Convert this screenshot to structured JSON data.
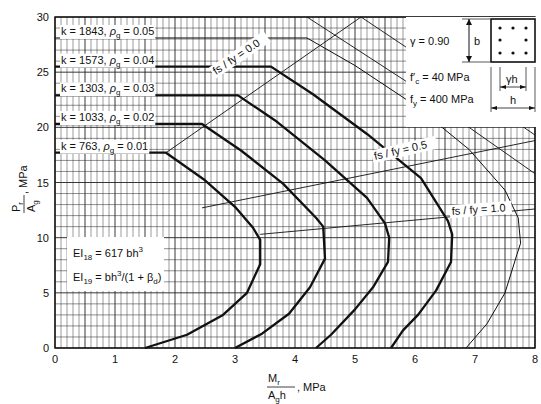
{
  "chart_data": {
    "type": "line",
    "title": "",
    "xlabel": "Mr / (Ag h), MPa",
    "ylabel": "Pr / Ag, MPa",
    "xlim": [
      0,
      8
    ],
    "ylim": [
      0,
      30
    ],
    "x_ticks": [
      "0",
      "1",
      "2",
      "3",
      "4",
      "5",
      "6",
      "7",
      "8"
    ],
    "y_ticks": [
      "0",
      "5",
      "10",
      "15",
      "20",
      "25",
      "30"
    ],
    "grid": true,
    "series": [
      {
        "name": "k = 763, ρg = 0.01",
        "k": 763,
        "rho_g": 0.01,
        "weight": "bold",
        "points": [
          [
            0,
            17.7
          ],
          [
            1.85,
            17.7
          ],
          [
            2.5,
            15.2
          ],
          [
            3.0,
            12.8
          ],
          [
            3.3,
            10.9
          ],
          [
            3.42,
            9.8
          ],
          [
            3.42,
            7.6
          ],
          [
            3.2,
            5.0
          ],
          [
            2.8,
            3.0
          ],
          [
            2.2,
            1.2
          ],
          [
            1.5,
            0
          ]
        ]
      },
      {
        "name": "k = 1033, ρg = 0.02",
        "k": 1033,
        "rho_g": 0.02,
        "weight": "bold",
        "points": [
          [
            0,
            20.3
          ],
          [
            2.45,
            20.3
          ],
          [
            3.1,
            17.9
          ],
          [
            3.8,
            14.9
          ],
          [
            4.35,
            11.8
          ],
          [
            4.47,
            11.0
          ],
          [
            4.5,
            8.1
          ],
          [
            4.25,
            5.5
          ],
          [
            3.9,
            3.1
          ],
          [
            3.45,
            1.3
          ],
          [
            3.0,
            0
          ]
        ]
      },
      {
        "name": "k = 1303, ρg = 0.03",
        "k": 1303,
        "rho_g": 0.03,
        "weight": "bold",
        "points": [
          [
            0,
            22.9
          ],
          [
            3.05,
            22.9
          ],
          [
            3.7,
            20.5
          ],
          [
            4.5,
            17.0
          ],
          [
            5.2,
            13.6
          ],
          [
            5.5,
            11.3
          ],
          [
            5.57,
            10.0
          ],
          [
            5.55,
            7.8
          ],
          [
            5.3,
            5.5
          ],
          [
            5.0,
            3.5
          ],
          [
            4.6,
            1.2
          ],
          [
            4.35,
            0
          ]
        ]
      },
      {
        "name": "k = 1573, ρg = 0.04",
        "k": 1573,
        "rho_g": 0.04,
        "weight": "bold",
        "points": [
          [
            0,
            25.5
          ],
          [
            3.6,
            25.5
          ],
          [
            4.3,
            23.0
          ],
          [
            5.2,
            19.4
          ],
          [
            6.1,
            15.4
          ],
          [
            6.55,
            11.5
          ],
          [
            6.62,
            10.3
          ],
          [
            6.6,
            7.8
          ],
          [
            6.35,
            5.2
          ],
          [
            6.05,
            3.0
          ],
          [
            5.8,
            1.6
          ],
          [
            5.6,
            0
          ]
        ]
      },
      {
        "name": "k = 1843, ρg = 0.05",
        "k": 1843,
        "rho_g": 0.05,
        "weight": "thin",
        "points": [
          [
            0,
            28.1
          ],
          [
            4.2,
            28.1
          ],
          [
            5.0,
            25.6
          ],
          [
            6.0,
            22.0
          ],
          [
            6.9,
            18.0
          ],
          [
            7.5,
            14.3
          ],
          [
            7.72,
            11.8
          ],
          [
            7.76,
            9.5
          ],
          [
            7.7,
            8.5
          ],
          [
            7.5,
            5.0
          ],
          [
            7.2,
            2.2
          ],
          [
            6.85,
            0
          ]
        ]
      }
    ],
    "reference_lines": [
      {
        "name": "fs / fy = 0.0",
        "points": [
          [
            1.85,
            17.7
          ],
          [
            5.1,
            30
          ]
        ]
      },
      {
        "name": "fs / fy = 0.5",
        "points": [
          [
            2.45,
            12.7
          ],
          [
            8,
            18.8
          ]
        ]
      },
      {
        "name": "fs / fy = 1.0",
        "points": [
          [
            3.42,
            10.3
          ],
          [
            8,
            12.6
          ]
        ]
      }
    ],
    "annotations": [
      "k = 1843, ρg = 0.05",
      "k = 1573, ρg = 0.04",
      "k = 1303, ρg = 0.03",
      "k = 1033, ρg = 0.02",
      "k = 763, ρg = 0.01",
      "fs / fy = 0.0",
      "fs / fy = 0.5",
      "fs / fy = 1.0",
      "EI18 = 617 bh³",
      "EI19 = bh³/(1 + βd)"
    ],
    "legend_position": "top-right (parameter box)"
  },
  "labels": {
    "curves": [
      {
        "k": "k = 1843,",
        "rho": "ρ",
        "rho_sub": "g",
        "val": "= 0.05"
      },
      {
        "k": "k = 1573,",
        "rho": "ρ",
        "rho_sub": "g",
        "val": "= 0.04"
      },
      {
        "k": "k = 1303,",
        "rho": "ρ",
        "rho_sub": "g",
        "val": "= 0.03"
      },
      {
        "k": "k = 1033,",
        "rho": "ρ",
        "rho_sub": "g",
        "val": "= 0.02"
      },
      {
        "k": "k =  763,",
        "rho": "ρ",
        "rho_sub": "g",
        "val": "= 0.01"
      }
    ],
    "fs0": "fs / fy = 0.0",
    "fs05": "fs / fy = 0.5",
    "fs10": "fs / fy = 1.0",
    "ei18_pre": "EI",
    "ei18_sub": "18",
    "ei18_post": " = 617 bh",
    "ei18_sup": "3",
    "ei19_pre": "EI",
    "ei19_sub": "19",
    "ei19_post": " = bh",
    "ei19_sup": "3",
    "ei19_tail": "/(1 + β",
    "ei19_tail_sub": "d",
    "ei19_end": ")"
  },
  "legend": {
    "gamma": "γ  =  0.90",
    "fc": "f′c =  40  MPa",
    "fc_pre": "f′",
    "fc_sub": "c",
    "fc_post": " =  40  MPa",
    "fy_pre": "f",
    "fy_sub": "y",
    "fy_post": " =  400  MPa",
    "b": "b",
    "gh": "γh",
    "h": "h"
  },
  "axes": {
    "x_title_num": "M",
    "x_title_num_sub": "r",
    "x_title_den": "A",
    "x_title_den_sub": "g",
    "x_title_den_tail": "h",
    "x_title_unit": ", MPa",
    "y_title_num": "P",
    "y_title_num_sub": "r",
    "y_title_den": "A",
    "y_title_den_sub": "g",
    "y_title_unit": ", MPa"
  }
}
